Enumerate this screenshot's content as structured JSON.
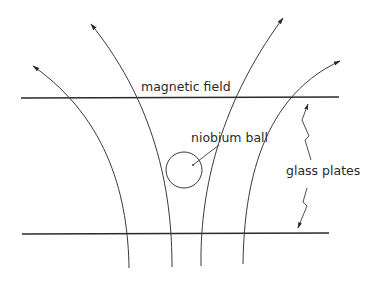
{
  "labels": {
    "magnetic_field": "magnetic field",
    "niobium_ball": "niobium ball",
    "glass_plates": "glass plates"
  },
  "colors": {
    "background": "#ffffff",
    "ink": "#2a2a2a"
  },
  "elements": {
    "plates": [
      {
        "name": "top-glass-plate",
        "y": 98,
        "x1": 21,
        "x2": 339
      },
      {
        "name": "bottom-glass-plate",
        "y": 234,
        "x1": 22,
        "x2": 329
      }
    ],
    "ball": {
      "cx": 184,
      "cy": 170,
      "r": 18
    },
    "field_lines": 4
  }
}
